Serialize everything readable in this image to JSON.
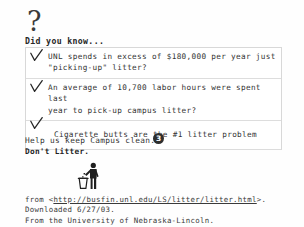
{
  "document": {
    "question_mark": "?",
    "heading": "Did you know...",
    "facts": [
      {
        "check_icon": "checkmark-icon",
        "text": "UNL spends in excess of $180,000 per year just\n\"picking-up\" litter?"
      },
      {
        "check_icon": "checkmark-icon",
        "text": "An average of 10,700 labor hours were spent last\nyear to pick-up campus litter?"
      },
      {
        "check_icon": "checkmark-icon",
        "text": "Cigarette butts are the #1 litter problem"
      }
    ],
    "message": {
      "line1": "Help us keep Campus clean.",
      "line2": "Don't Litter.",
      "badge": "3"
    },
    "pictogram": {
      "icon": "person-throwing-litter-in-bin-icon"
    },
    "footer": {
      "line1_prefix": "from <",
      "line1_url": "http://busfin.unl.edu/LS/litter/litter.html",
      "line1_suffix": ">.",
      "line2": "Downloaded 6/27/03.",
      "line3": "From the University of Nebraska-Lincoln."
    }
  },
  "colors": {
    "ink": "#333333",
    "badge_fill": "#2e2e2e",
    "table_border": "#dddddd",
    "page_background": "#fefefe"
  }
}
